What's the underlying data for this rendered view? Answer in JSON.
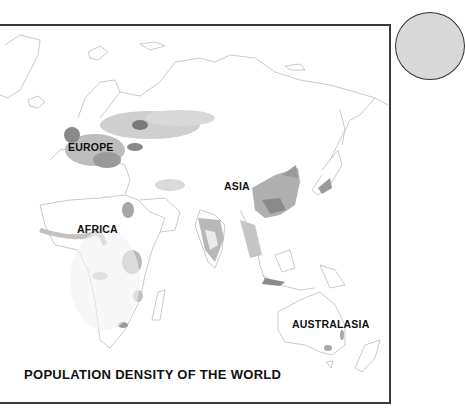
{
  "map": {
    "title": "POPULATION DENSITY OF THE WORLD",
    "regions": [
      {
        "name": "EUROPE",
        "x": 68,
        "y": 141
      },
      {
        "name": "ASIA",
        "x": 224,
        "y": 180
      },
      {
        "name": "AFRICA",
        "x": 77,
        "y": 223
      },
      {
        "name": "AUSTRALASIA",
        "x": 292,
        "y": 318
      }
    ],
    "colors": {
      "coastline": "#b8b8b8",
      "density_low": "#ececec",
      "density_medium": "#c4c4c4",
      "density_high": "#9a9a9a",
      "density_very_high": "#6e6e6e",
      "frame": "#3a3a3a",
      "globe_fill": "#d8d8d8"
    }
  }
}
